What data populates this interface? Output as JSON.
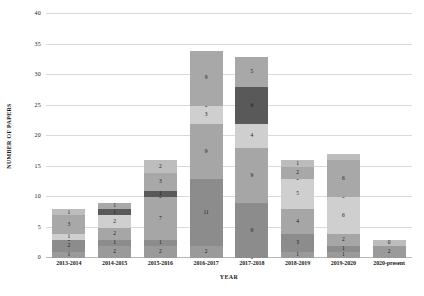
{
  "chart_data": {
    "type": "bar",
    "subtype": "stacked-bar",
    "title": "",
    "xlabel": "YEAR",
    "ylabel": "NUMBER OF PAPERS",
    "ylim": [
      0,
      40
    ],
    "ytick_step": 5,
    "yticks": [
      0,
      5,
      10,
      15,
      20,
      25,
      30,
      35,
      40
    ],
    "grid": true,
    "legend": "none",
    "categories": [
      "2013-2014",
      "2014-2015",
      "2015-2016",
      "2016-2017",
      "2017-2018",
      "2018-2019",
      "2019-2020",
      "2020-present"
    ],
    "series": [
      {
        "name": "Series 1",
        "color": "#9a9a9a",
        "values": [
          1,
          2,
          2,
          2,
          0,
          1,
          1,
          2
        ]
      },
      {
        "name": "Series 2",
        "color": "#8c8c8c",
        "values": [
          2,
          1,
          1,
          11,
          9,
          3,
          1,
          0
        ]
      },
      {
        "name": "Series 3",
        "color": "#a6a6a6",
        "values": [
          0,
          2,
          7,
          9,
          9,
          4,
          2,
          0
        ]
      },
      {
        "name": "Series 4",
        "color": "#cfcfcf",
        "values": [
          1,
          2,
          0,
          3,
          4,
          5,
          6,
          0
        ]
      },
      {
        "name": "Series 5",
        "color": "#595959",
        "values": [
          0,
          1,
          1,
          0,
          6,
          0,
          0,
          0
        ]
      },
      {
        "name": "Series 6",
        "color": "#a8a8a8",
        "values": [
          3,
          1,
          3,
          9,
          5,
          2,
          6,
          0
        ]
      },
      {
        "name": "Series 7",
        "color": "#bdbdbd",
        "values": [
          1,
          0,
          2,
          0,
          0,
          1,
          1,
          1
        ]
      }
    ],
    "totals": [
      8,
      9,
      16,
      34,
      33,
      16,
      17,
      3
    ],
    "bar_labels": [
      [
        "1",
        "2",
        "0",
        "1",
        "",
        "3",
        "1"
      ],
      [
        "2",
        "1",
        "2",
        "2",
        "1",
        "1",
        ""
      ],
      [
        "2",
        "1",
        "7",
        "0",
        "1",
        "3",
        "2"
      ],
      [
        "2",
        "11",
        "9",
        "3",
        "0",
        "9",
        ""
      ],
      [
        "0",
        "9",
        "9",
        "4",
        "6",
        "5",
        ""
      ],
      [
        "1",
        "3",
        "4",
        "5",
        "0",
        "2",
        "1"
      ],
      [
        "1",
        "1",
        "2",
        "6",
        "0",
        "6",
        ""
      ],
      [
        "2",
        "",
        "",
        "",
        "",
        "",
        "0"
      ]
    ]
  },
  "axis": {
    "y_title": "NUMBER OF PAPERS",
    "x_title": "YEAR"
  }
}
